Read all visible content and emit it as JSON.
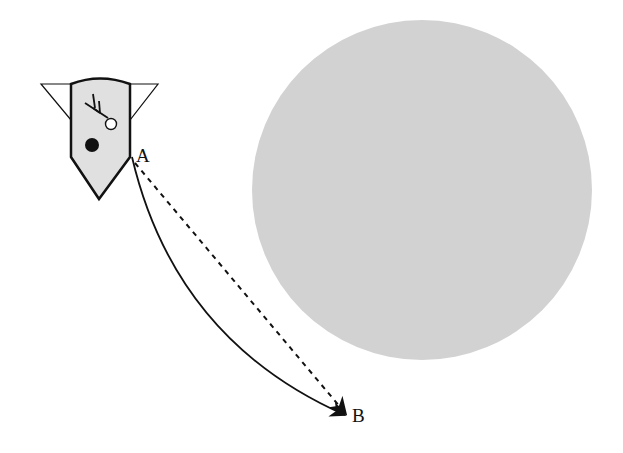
{
  "diagram": {
    "labels": {
      "a": "A",
      "b": "B"
    },
    "colors": {
      "circle_fill": "#d2d2d2",
      "ship_fill": "#e0e0e0",
      "stroke": "#111111",
      "background": "#ffffff"
    },
    "elements": {
      "large_circle": {
        "cx": 422,
        "cy": 190,
        "r": 170
      },
      "point_a": {
        "x": 132,
        "y": 157
      },
      "point_b": {
        "x": 350,
        "y": 415
      },
      "curved_path": "solid",
      "straight_path": "dashed"
    }
  }
}
